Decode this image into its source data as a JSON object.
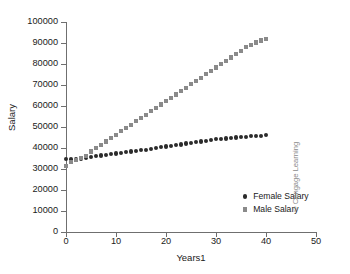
{
  "chart_data": {
    "type": "scatter",
    "title": "",
    "xlabel": "Years1",
    "ylabel": "Salary",
    "xlim": [
      0,
      50
    ],
    "ylim": [
      0,
      100000
    ],
    "xticks": [
      0,
      10,
      20,
      30,
      40,
      50
    ],
    "yticks": [
      0,
      10000,
      20000,
      30000,
      40000,
      50000,
      60000,
      70000,
      80000,
      90000,
      100000
    ],
    "xtick_labels": [
      "0",
      "10",
      "20",
      "30",
      "40",
      "50"
    ],
    "ytick_labels": [
      "0",
      "10000",
      "20000",
      "30000",
      "40000",
      "50000",
      "60000",
      "70000",
      "80000",
      "90000",
      "100000"
    ],
    "grid": false,
    "legend_position": "lower-right-inside",
    "x": [
      0,
      1,
      2,
      3,
      4,
      5,
      6,
      7,
      8,
      9,
      10,
      11,
      12,
      13,
      14,
      15,
      16,
      17,
      18,
      19,
      20,
      21,
      22,
      23,
      24,
      25,
      26,
      27,
      28,
      29,
      30,
      31,
      32,
      33,
      34,
      35,
      36,
      37,
      38,
      39,
      40
    ],
    "series": [
      {
        "name": "Female Salary",
        "marker": "circle",
        "color": "#2b2b2b",
        "values": [
          34800,
          34500,
          34600,
          34900,
          35300,
          35700,
          36100,
          36400,
          36800,
          37100,
          37400,
          37700,
          38000,
          38300,
          38600,
          38900,
          39200,
          39600,
          40000,
          40300,
          40700,
          41000,
          41400,
          41700,
          42100,
          42400,
          42800,
          43100,
          43500,
          43800,
          44100,
          44300,
          44500,
          44800,
          45000,
          45200,
          45400,
          45600,
          45800,
          45900,
          46000
        ]
      },
      {
        "name": "Male Salary",
        "marker": "square",
        "color": "#8a8a8a",
        "values": [
          31500,
          33300,
          34400,
          35200,
          36100,
          38300,
          39900,
          41500,
          43100,
          44700,
          46300,
          47900,
          49500,
          51100,
          52700,
          54300,
          55900,
          57500,
          59100,
          60700,
          62300,
          63900,
          65500,
          67100,
          68700,
          70300,
          71900,
          73500,
          75100,
          76700,
          78300,
          79900,
          81500,
          83100,
          84700,
          86300,
          87900,
          89000,
          90200,
          91200,
          92000
        ]
      }
    ]
  },
  "legend": {
    "items": [
      {
        "label": "Female Salary"
      },
      {
        "label": "Male Salary"
      }
    ]
  },
  "credit": {
    "text": "© Cengage Learning"
  }
}
